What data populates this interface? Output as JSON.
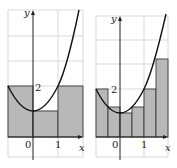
{
  "figure": {
    "colors": {
      "background": "#ffffff",
      "grid": "#cfcfcf",
      "rect_fill": "#b8b8b8",
      "rect_stroke": "#3a3a3a",
      "curve": "#111111",
      "axis": "#222222"
    }
  },
  "panels": [
    {
      "name": "left",
      "axis_labels": {
        "x": "x",
        "y": "y"
      },
      "tick_labels": {
        "origin": "0",
        "x_one": "1",
        "y_two": "2"
      },
      "function": "x^2 + 1",
      "n_rectangles": 3,
      "rectangles": [
        {
          "x0": -1,
          "x1": 0,
          "height": 2
        },
        {
          "x0": 0,
          "x1": 1,
          "height": 1
        },
        {
          "x0": 1,
          "x1": 2,
          "height": 2
        }
      ]
    },
    {
      "name": "right",
      "axis_labels": {
        "x": "x",
        "y": "y"
      },
      "tick_labels": {
        "origin": "0",
        "x_one": "1",
        "y_two": "2"
      },
      "function": "x^2 + 1",
      "n_rectangles": 6,
      "rectangles": [
        {
          "x0": -1,
          "x1": -0.5,
          "height": 2
        },
        {
          "x0": -0.5,
          "x1": 0,
          "height": 1.25
        },
        {
          "x0": 0,
          "x1": 0.5,
          "height": 1
        },
        {
          "x0": 0.5,
          "x1": 1,
          "height": 1.25
        },
        {
          "x0": 1,
          "x1": 1.5,
          "height": 2
        },
        {
          "x0": 1.5,
          "x1": 2,
          "height": 3.25
        }
      ]
    }
  ]
}
